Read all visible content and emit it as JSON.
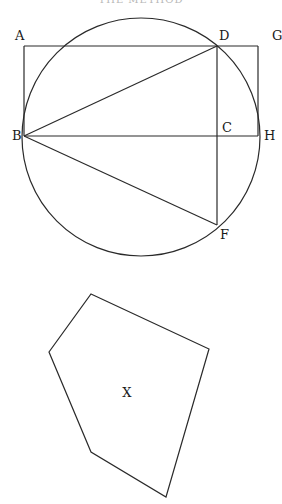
{
  "header": {
    "text": "THE METHOD"
  },
  "figure1": {
    "circle": {
      "cx": 141,
      "cy": 137,
      "r": 119
    },
    "points": {
      "A": {
        "x": 24,
        "y": 46,
        "label": "A"
      },
      "B": {
        "x": 24,
        "y": 136,
        "label": "B"
      },
      "C": {
        "x": 217,
        "y": 136,
        "label": "C"
      },
      "D": {
        "x": 217,
        "y": 46,
        "label": "D"
      },
      "F": {
        "x": 217,
        "y": 225,
        "label": "F"
      },
      "G": {
        "x": 258,
        "y": 46,
        "label": "G"
      },
      "H": {
        "x": 258,
        "y": 136,
        "label": "H"
      }
    },
    "segments": [
      [
        "A",
        "G"
      ],
      [
        "A",
        "B"
      ],
      [
        "G",
        "H"
      ],
      [
        "B",
        "H"
      ],
      [
        "B",
        "D"
      ],
      [
        "B",
        "F"
      ],
      [
        "D",
        "F"
      ]
    ]
  },
  "figure2": {
    "label": "X",
    "vertices": [
      [
        91,
        294
      ],
      [
        209,
        349
      ],
      [
        166,
        497
      ],
      [
        91,
        452
      ],
      [
        49,
        352
      ]
    ]
  }
}
